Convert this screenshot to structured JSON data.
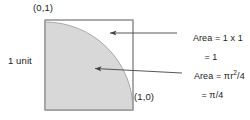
{
  "diagram": {
    "shapes": {
      "square": {
        "name": "unit-square",
        "x": 45,
        "y": 20,
        "width": 88,
        "height": 90,
        "stroke": "#8f8f8f",
        "fill": "#ffffff"
      },
      "quarter_circle": {
        "name": "quarter-circle-sector",
        "center_x": 45,
        "center_y": 110,
        "radius": 88,
        "fill": "#d8d8d8",
        "stroke": "#9a9a9a"
      }
    },
    "vertex_labels": [
      {
        "id": "top-left",
        "text": "(0,1)"
      },
      {
        "id": "bottom-right",
        "text": "(1,0)"
      }
    ],
    "side_label": "1 unit",
    "annotations": [
      {
        "id": "square-area",
        "line1": "Area = 1 x 1",
        "line2": "= 1",
        "arrow": {
          "from_x": 177,
          "from_y": 33,
          "to_x": 110,
          "to_y": 33
        }
      },
      {
        "id": "quarter-circle-area",
        "line1_prefix": "Area = πr",
        "line1_sup": "2",
        "line1_suffix": "/4",
        "line2": "= π/4",
        "arrow": {
          "from_x": 182,
          "from_y": 73,
          "to_x": 93,
          "to_y": 68
        }
      }
    ],
    "colors": {
      "shade": "#d8d8d8",
      "line": "#555555",
      "square_border": "#8f8f8f",
      "text": "#1a1a1a",
      "background": "#ffffff"
    }
  }
}
